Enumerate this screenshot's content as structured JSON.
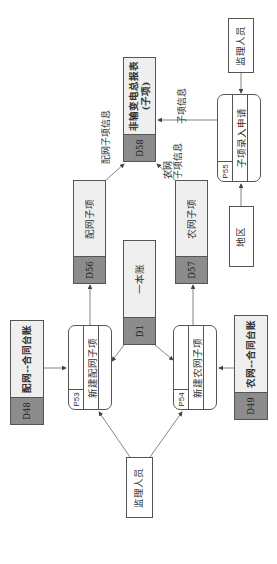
{
  "diagram": {
    "orientation": "rotated -90deg",
    "external_entities": [
      {
        "id": "E1",
        "label": "监理人员"
      },
      {
        "id": "E2",
        "label": "监理人员"
      },
      {
        "id": "E3",
        "label": "地区"
      }
    ],
    "processes": [
      {
        "id": "P53",
        "label": "新建配网子项"
      },
      {
        "id": "P54",
        "label": "新建农网子项"
      },
      {
        "id": "P55",
        "label": "子项录入申请"
      }
    ],
    "data_stores": [
      {
        "id": "D48",
        "label": "配网--合同台账"
      },
      {
        "id": "D49",
        "label": "农网--合同台账"
      },
      {
        "id": "D1",
        "label": "一本账"
      },
      {
        "id": "D56",
        "label": "配网子项"
      },
      {
        "id": "D57",
        "label": "农网子项"
      },
      {
        "id": "D58",
        "label": "非输变电总报表",
        "sublabel": "(子项)"
      }
    ],
    "flow_labels": {
      "peiwang_info": "配网子项信息",
      "nongwang_info_line1": "农网",
      "nongwang_info_line2": "子项信息",
      "zixiang_info": "子项信息"
    }
  }
}
